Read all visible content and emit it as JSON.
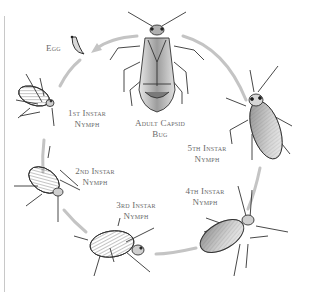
{
  "diagram": {
    "colors": {
      "arrow": "#c4c4c4",
      "label_text": "#6a6a6a",
      "insect_ink": "#333333",
      "insect_shade": "#9a9a9a",
      "left_rule": "#c8c8c8"
    },
    "stages": [
      {
        "id": "egg",
        "line1": "Egg",
        "line2": ""
      },
      {
        "id": "instar-1",
        "line1": "1st Instar",
        "line2": "Nymph"
      },
      {
        "id": "instar-2",
        "line1": "2nd Instar",
        "line2": "Nymph"
      },
      {
        "id": "instar-3",
        "line1": "3rd Instar",
        "line2": "Nymph"
      },
      {
        "id": "instar-4",
        "line1": "4th Instar",
        "line2": "Nymph"
      },
      {
        "id": "instar-5",
        "line1": "5th Instar",
        "line2": "Nymph"
      },
      {
        "id": "adult",
        "line1": "Adult Capsid",
        "line2": "Bug"
      }
    ],
    "cycle_order": [
      "adult",
      "egg",
      "instar-1",
      "instar-2",
      "instar-3",
      "instar-4",
      "instar-5",
      "adult"
    ]
  }
}
